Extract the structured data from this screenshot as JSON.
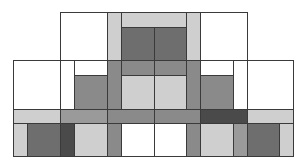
{
  "diagram": {
    "title": "",
    "palette": {
      "white": "#ffffff",
      "light": "#cfcfcf",
      "mid": "#9a9a9a",
      "medium_dark": "#8a8a8a",
      "dark": "#6e6e6e",
      "darkest": "#4a4a4a",
      "border": "#3a3a3a"
    },
    "rects": [
      {
        "id": "top-left-white",
        "x": 60,
        "y": 12,
        "w": 47,
        "h": 48,
        "fill": "#ffffff"
      },
      {
        "id": "top-left-light-strip",
        "x": 107,
        "y": 12,
        "w": 14,
        "h": 48,
        "fill": "#cfcfcf"
      },
      {
        "id": "top-center-light-top",
        "x": 121,
        "y": 12,
        "w": 65,
        "h": 15,
        "fill": "#cfcfcf"
      },
      {
        "id": "top-center-dark-left",
        "x": 121,
        "y": 27,
        "w": 33,
        "h": 33,
        "fill": "#6e6e6e"
      },
      {
        "id": "top-center-dark-right",
        "x": 154,
        "y": 27,
        "w": 32,
        "h": 33,
        "fill": "#6e6e6e"
      },
      {
        "id": "top-right-light-strip",
        "x": 186,
        "y": 12,
        "w": 14,
        "h": 48,
        "fill": "#cfcfcf"
      },
      {
        "id": "top-right-white",
        "x": 200,
        "y": 12,
        "w": 47,
        "h": 48,
        "fill": "#ffffff"
      },
      {
        "id": "mid-far-left-white",
        "x": 13,
        "y": 60,
        "w": 47,
        "h": 49,
        "fill": "#ffffff"
      },
      {
        "id": "mid-left-white-narrow",
        "x": 60,
        "y": 60,
        "w": 14,
        "h": 49,
        "fill": "#ffffff"
      },
      {
        "id": "mid-left-white-top",
        "x": 74,
        "y": 60,
        "w": 33,
        "h": 15,
        "fill": "#ffffff"
      },
      {
        "id": "mid-left-dark",
        "x": 74,
        "y": 75,
        "w": 33,
        "h": 34,
        "fill": "#8a8a8a"
      },
      {
        "id": "mid-left-column",
        "x": 107,
        "y": 60,
        "w": 14,
        "h": 49,
        "fill": "#8a8a8a"
      },
      {
        "id": "mid-center-band-left",
        "x": 121,
        "y": 60,
        "w": 33,
        "h": 15,
        "fill": "#8a8a8a"
      },
      {
        "id": "mid-center-band-right",
        "x": 154,
        "y": 60,
        "w": 32,
        "h": 15,
        "fill": "#8a8a8a"
      },
      {
        "id": "mid-center-light-left",
        "x": 121,
        "y": 75,
        "w": 33,
        "h": 34,
        "fill": "#cfcfcf"
      },
      {
        "id": "mid-center-light-right",
        "x": 154,
        "y": 75,
        "w": 32,
        "h": 34,
        "fill": "#cfcfcf"
      },
      {
        "id": "mid-right-column",
        "x": 186,
        "y": 60,
        "w": 14,
        "h": 49,
        "fill": "#8a8a8a"
      },
      {
        "id": "mid-right-white-top",
        "x": 200,
        "y": 60,
        "w": 33,
        "h": 15,
        "fill": "#ffffff"
      },
      {
        "id": "mid-right-dark",
        "x": 200,
        "y": 75,
        "w": 33,
        "h": 34,
        "fill": "#8a8a8a"
      },
      {
        "id": "mid-right-white-narrow",
        "x": 233,
        "y": 60,
        "w": 14,
        "h": 49,
        "fill": "#ffffff"
      },
      {
        "id": "mid-far-right-white",
        "x": 247,
        "y": 60,
        "w": 46,
        "h": 49,
        "fill": "#ffffff"
      },
      {
        "id": "bar-far-left-light",
        "x": 13,
        "y": 109,
        "w": 47,
        "h": 14,
        "fill": "#cfcfcf"
      },
      {
        "id": "bar-left-mid",
        "x": 60,
        "y": 109,
        "w": 47,
        "h": 14,
        "fill": "#9a9a9a"
      },
      {
        "id": "bar-center-left",
        "x": 107,
        "y": 109,
        "w": 47,
        "h": 14,
        "fill": "#8a8a8a"
      },
      {
        "id": "bar-center-right",
        "x": 154,
        "y": 109,
        "w": 46,
        "h": 14,
        "fill": "#8a8a8a"
      },
      {
        "id": "bar-right-darkest",
        "x": 200,
        "y": 109,
        "w": 47,
        "h": 14,
        "fill": "#4a4a4a"
      },
      {
        "id": "bar-far-right-light",
        "x": 247,
        "y": 109,
        "w": 46,
        "h": 14,
        "fill": "#cfcfcf"
      },
      {
        "id": "bot-1-light",
        "x": 13,
        "y": 123,
        "w": 14,
        "h": 33,
        "fill": "#cfcfcf"
      },
      {
        "id": "bot-2-dark",
        "x": 27,
        "y": 123,
        "w": 33,
        "h": 33,
        "fill": "#6e6e6e"
      },
      {
        "id": "bot-3-darkest",
        "x": 60,
        "y": 123,
        "w": 14,
        "h": 33,
        "fill": "#4a4a4a"
      },
      {
        "id": "bot-4-light",
        "x": 74,
        "y": 123,
        "w": 33,
        "h": 33,
        "fill": "#cfcfcf"
      },
      {
        "id": "bot-5-mid",
        "x": 107,
        "y": 123,
        "w": 14,
        "h": 33,
        "fill": "#8a8a8a"
      },
      {
        "id": "bot-6-white",
        "x": 121,
        "y": 123,
        "w": 33,
        "h": 33,
        "fill": "#ffffff"
      },
      {
        "id": "bot-7-white",
        "x": 154,
        "y": 123,
        "w": 32,
        "h": 33,
        "fill": "#ffffff"
      },
      {
        "id": "bot-8-mid",
        "x": 186,
        "y": 123,
        "w": 14,
        "h": 33,
        "fill": "#8a8a8a"
      },
      {
        "id": "bot-9-light",
        "x": 200,
        "y": 123,
        "w": 33,
        "h": 33,
        "fill": "#cfcfcf"
      },
      {
        "id": "bot-10-mid",
        "x": 233,
        "y": 123,
        "w": 14,
        "h": 33,
        "fill": "#9a9a9a"
      },
      {
        "id": "bot-11-dark",
        "x": 247,
        "y": 123,
        "w": 32,
        "h": 33,
        "fill": "#6e6e6e"
      },
      {
        "id": "bot-12-light",
        "x": 279,
        "y": 123,
        "w": 14,
        "h": 33,
        "fill": "#cfcfcf"
      }
    ]
  }
}
